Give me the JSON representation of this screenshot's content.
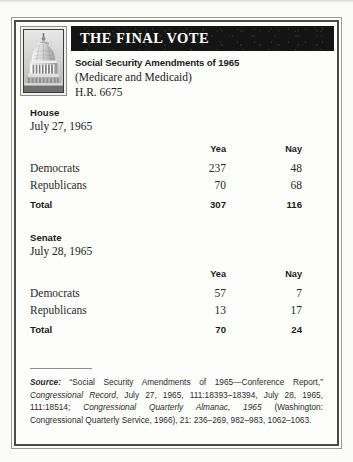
{
  "document": {
    "title": "THE FINAL VOTE",
    "bill": {
      "name": "Social Security Amendments of 1965",
      "subtitle": "(Medicare and Medicaid)",
      "number": "H.R. 6675"
    },
    "icon": "capitol-dome-photo",
    "columns": {
      "party": "",
      "yea": "Yea",
      "nay": "Nay"
    },
    "chambers": [
      {
        "name": "House",
        "date": "July 27, 1965",
        "rows": [
          {
            "party": "Democrats",
            "yea": "237",
            "nay": "48"
          },
          {
            "party": "Republicans",
            "yea": "70",
            "nay": "68"
          }
        ],
        "total": {
          "party": "Total",
          "yea": "307",
          "nay": "116"
        }
      },
      {
        "name": "Senate",
        "date": "July 28, 1965",
        "rows": [
          {
            "party": "Democrats",
            "yea": "57",
            "nay": "7"
          },
          {
            "party": "Republicans",
            "yea": "13",
            "nay": "17"
          }
        ],
        "total": {
          "party": "Total",
          "yea": "70",
          "nay": "24"
        }
      }
    ],
    "source": {
      "label": "Source:",
      "part1": " “Social Security Amendments of 1965—Conference Report,” ",
      "italic1": "Congressional Record",
      "part2": ", July 27, 1965, 111:18393–18394, July 28, 1965, 111:18514; ",
      "italic2": "Congressional Quarterly Almanac, 1965",
      "part3": " (Washington: Congressional Quarterly Service, 1966), 21: 236–269, 982–983, 1062–1063."
    }
  },
  "colors": {
    "title_band": "#141414",
    "frame": "#4a4a4a",
    "page_bg": "#fbfbfa",
    "card_bg": "#fdfdfc",
    "text": "#1b1b1b"
  }
}
